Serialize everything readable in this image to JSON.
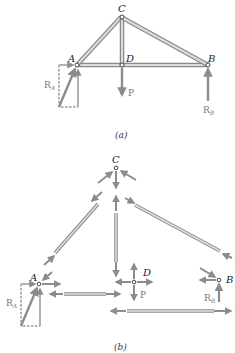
{
  "figure": {
    "part_a": {
      "caption": "(a)",
      "joints": {
        "A": {
          "label": "A"
        },
        "B": {
          "label": "B"
        },
        "C": {
          "label": "C"
        },
        "D": {
          "label": "D"
        }
      },
      "members": [
        "AC",
        "CD",
        "CB",
        "AD",
        "DB"
      ],
      "loads": {
        "P": {
          "label": "P",
          "direction": "down",
          "at": "D"
        },
        "RA": {
          "label": "R",
          "sub": "A",
          "direction": "up-right",
          "at": "A"
        },
        "RB": {
          "label": "R",
          "sub": "B",
          "direction": "up",
          "at": "B"
        }
      }
    },
    "part_b": {
      "caption": "(b)",
      "joints": {
        "A": {
          "label": "A"
        },
        "B": {
          "label": "B"
        },
        "C": {
          "label": "C"
        },
        "D": {
          "label": "D"
        }
      },
      "loads": {
        "P": {
          "label": "P"
        },
        "RA": {
          "label": "R",
          "sub": "A"
        },
        "RB": {
          "label": "R",
          "sub": "B"
        }
      }
    },
    "colors": {
      "member_fill": "#c8c8c8",
      "member_edge": "#8a8a8a",
      "arrow": "#8c8c8c",
      "dashed": "#555555",
      "label": "#222222",
      "force_label": "#777777"
    }
  }
}
